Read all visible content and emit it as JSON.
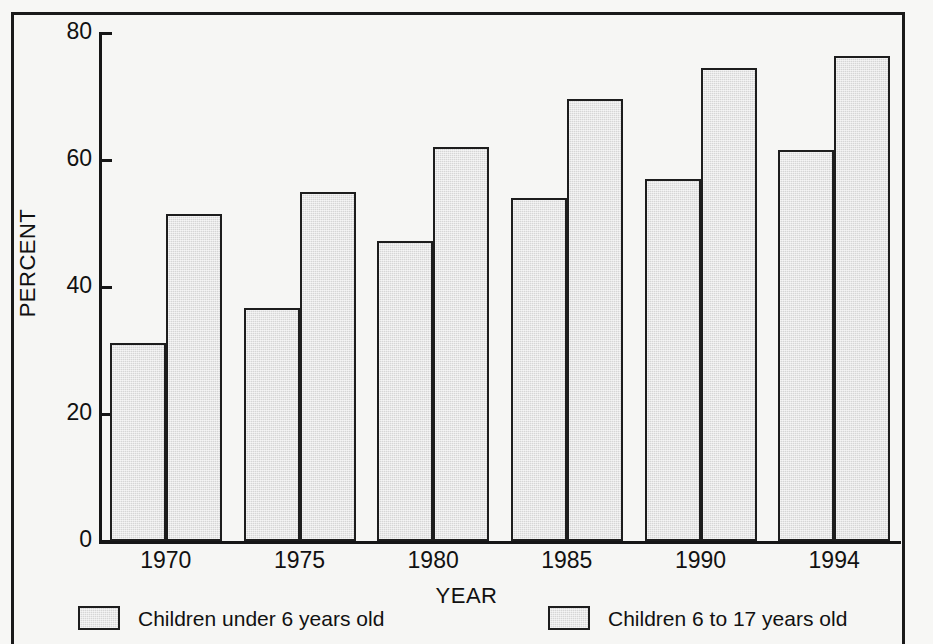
{
  "chart_data": {
    "type": "bar",
    "title": "",
    "subtitle": "",
    "xlabel": "YEAR",
    "ylabel": "PERCENT",
    "categories": [
      "1970",
      "1975",
      "1980",
      "1985",
      "1990",
      "1994"
    ],
    "series": [
      {
        "name": "Children under 6 years old",
        "values": [
          31.2,
          36.7,
          47.2,
          54.0,
          57.0,
          61.6
        ],
        "color": "#d6d6d6"
      },
      {
        "name": "Children 6 to 17 years old",
        "values": [
          51.5,
          55.0,
          62.1,
          69.6,
          74.5,
          76.3
        ],
        "color": "#d6d6d6"
      }
    ],
    "ylim": [
      0,
      80
    ],
    "yticks": [
      "0",
      "20",
      "40",
      "60",
      "80"
    ],
    "ytick_values": [
      0,
      20,
      40,
      60,
      80
    ],
    "grid": false,
    "legend_position": "bottom",
    "bar_border_color": "#1d1d1d",
    "axis_color": "#161616",
    "background_color": "#f6f6f4"
  },
  "legend": {
    "entries": [
      {
        "label": "Children under 6 years old"
      },
      {
        "label": "Children 6 to 17 years old"
      }
    ]
  },
  "axes": {
    "y_title": "PERCENT",
    "x_title": "YEAR"
  }
}
